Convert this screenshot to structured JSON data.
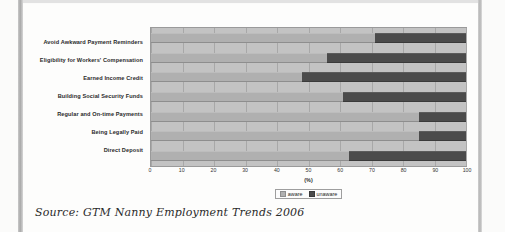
{
  "caption": {
    "source_text": "Source: GTM Nanny Employment Trends 2006"
  },
  "chart_data": {
    "type": "bar",
    "orientation": "horizontal",
    "stacked": true,
    "stack_total": 100,
    "title": "",
    "xlabel": "(%)",
    "ylabel": "",
    "xlim": [
      0,
      100
    ],
    "xticks": [
      0,
      10,
      20,
      30,
      40,
      50,
      60,
      70,
      80,
      90,
      100
    ],
    "xtick_labels": [
      "0",
      "10",
      "20",
      "30",
      "40",
      "50",
      "60",
      "70",
      "80",
      "90",
      "100"
    ],
    "grid": true,
    "grid_axis": "x",
    "legend_position": "bottom",
    "categories": [
      "Avoid Awkward Payment Reminders",
      "Eligibility for Workers' Compensation",
      "Earned Income Credit",
      "Building Social Security Funds",
      "Regular and On-time Payments",
      "Being Legally Paid",
      "Direct Deposit"
    ],
    "series": [
      {
        "name": "aware",
        "color": "#b0b0b0",
        "values": [
          71,
          56,
          48,
          61,
          85,
          85,
          63
        ]
      },
      {
        "name": "unaware",
        "color": "#4b4b4b",
        "values": [
          29,
          44,
          52,
          39,
          15,
          15,
          37
        ]
      }
    ]
  }
}
